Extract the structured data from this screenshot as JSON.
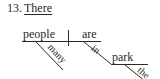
{
  "exercise": {
    "number": "13.",
    "sentence_start": "There"
  },
  "diagram": {
    "subject": "people",
    "verb": "are",
    "subject_modifier": "many",
    "preposition": "in",
    "prep_object": "park",
    "object_modifier": "the",
    "line_color": "#2a2a2a"
  }
}
